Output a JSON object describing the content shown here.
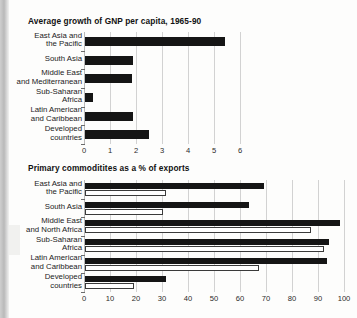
{
  "page": {
    "background_color": "#fdfdfc",
    "ink_color": "#151515",
    "grid_color": "#d2d2d2"
  },
  "charts": [
    {
      "id": "gnp-growth",
      "title": "Average growth of GNP per capita, 1965-90",
      "xticks": [
        "0",
        "1",
        "2",
        "3",
        "4",
        "5",
        "6"
      ]
    },
    {
      "id": "primary-commodities",
      "title": "Primary commoditites as a % of exports",
      "xticks": [
        "0",
        "10",
        "20",
        "30",
        "40",
        "50",
        "60",
        "70",
        "80",
        "90",
        "100"
      ]
    }
  ],
  "chart_data": [
    {
      "type": "bar",
      "orientation": "horizontal",
      "title": "Average growth of GNP per capita, 1965-90",
      "xlabel": "",
      "ylabel": "",
      "xlim": [
        0,
        6
      ],
      "xticks": [
        0,
        1,
        2,
        3,
        4,
        5,
        6
      ],
      "grid": true,
      "legend": "none",
      "categories": [
        "East Asia and the Pacific",
        "South Asia",
        "Middle East and Mediterranean",
        "Sub-Saharan Africa",
        "Latin American and Caribbean",
        "Developed countries"
      ],
      "category_lines": [
        [
          "East Asia and",
          "the Pacific"
        ],
        [
          "South Asia"
        ],
        [
          "Middle East",
          "and Mediterranean"
        ],
        [
          "Sub-Saharan",
          "Africa"
        ],
        [
          "Latin American",
          "and Caribbean"
        ],
        [
          "Developed",
          "countries"
        ]
      ],
      "series": [
        {
          "name": "Average annual growth of GNP per capita (%)",
          "color": "#151515",
          "style": "filled",
          "values": [
            5.4,
            1.85,
            1.8,
            0.3,
            1.85,
            2.45
          ]
        }
      ]
    },
    {
      "type": "bar",
      "orientation": "horizontal",
      "title": "Primary commoditites as a % of exports",
      "xlabel": "",
      "ylabel": "",
      "xlim": [
        0,
        100
      ],
      "xticks": [
        0,
        10,
        20,
        30,
        40,
        50,
        60,
        70,
        80,
        90,
        100
      ],
      "grid": true,
      "legend": "none",
      "categories": [
        "East Asia and the Pacific",
        "South Asia",
        "Middle East and North Africa",
        "Sub-Saharan Africa",
        "Latin American and Caribbean",
        "Developed countries"
      ],
      "category_lines": [
        [
          "East Asia and",
          "the Pacific"
        ],
        [
          "South Asia"
        ],
        [
          "Middle East",
          "and North Africa"
        ],
        [
          "Sub-Saharan",
          "Africa"
        ],
        [
          "Latin American",
          "and Caribbean"
        ],
        [
          "Developed",
          "countries"
        ]
      ],
      "series": [
        {
          "name": "Earlier year",
          "color": "#151515",
          "style": "filled",
          "values": [
            69,
            63,
            98,
            94,
            93,
            31
          ]
        },
        {
          "name": "Later year",
          "color": "#ffffff",
          "style": "outlined",
          "values": [
            31,
            30,
            87,
            92,
            67,
            19
          ]
        }
      ]
    }
  ]
}
